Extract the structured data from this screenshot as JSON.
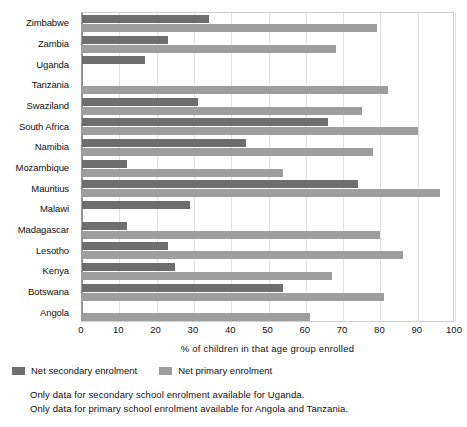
{
  "chart_data": {
    "type": "bar",
    "orientation": "horizontal",
    "title": "",
    "xlabel": "% of children in that age group enrolled",
    "ylabel": "",
    "xlim": [
      0,
      100
    ],
    "xticks": [
      0,
      10,
      20,
      30,
      40,
      50,
      60,
      70,
      80,
      90,
      100
    ],
    "grid": true,
    "legend_position": "below-left",
    "categories": [
      "Zimbabwe",
      "Zambia",
      "Uganda",
      "Tanzania",
      "Swaziland",
      "South Africa",
      "Namibia",
      "Mozambique",
      "Mauritius",
      "Malawi",
      "Madagascar",
      "Lesotho",
      "Kenya",
      "Botswana",
      "Angola"
    ],
    "series": [
      {
        "name": "Net secondary enrolment",
        "color": "#6e6e6e",
        "values": [
          34,
          23,
          17,
          null,
          31,
          66,
          44,
          12,
          74,
          29,
          12,
          23,
          25,
          54,
          null
        ]
      },
      {
        "name": "Net primary enrolment",
        "color": "#9e9e9e",
        "values": [
          79,
          68,
          null,
          82,
          75,
          90,
          78,
          54,
          96,
          null,
          80,
          86,
          67,
          81,
          61
        ]
      }
    ],
    "notes": [
      "Only data for secondary school enrolment available for Uganda.",
      "Only data for primary school enrolment available for Angola and Tanzania."
    ]
  }
}
